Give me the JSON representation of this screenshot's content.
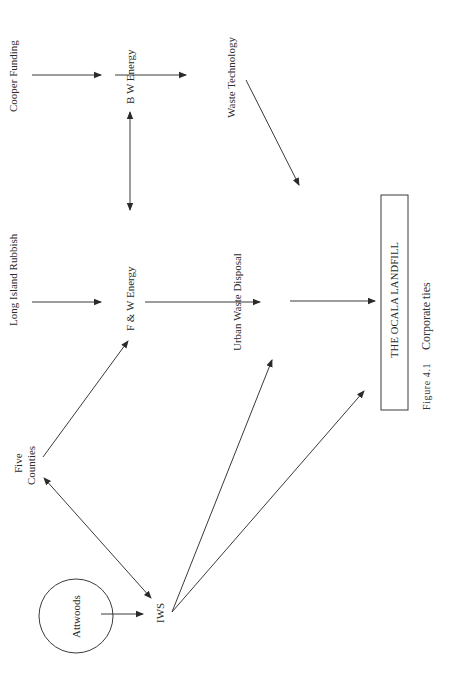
{
  "page": {
    "header_fragment": "...y... g... ...",
    "orientation": "rotated-90-clockwise"
  },
  "diagram": {
    "nodes": {
      "cooper_funding": "Cooper Funding",
      "bw_energy": "B W Energy",
      "waste_technology": "Waste Technology",
      "long_island_rubbish": "Long Island Rubbish",
      "fw_energy": "F & W Energy",
      "urban_waste_disposal": "Urban Waste Disposal",
      "five_counties_line1": "Five",
      "five_counties_line2": "Counties",
      "attwoods": "Attwoods",
      "iws": "IWS",
      "ocala_landfill": "THE OCALA LANDFILL"
    },
    "edges": [
      {
        "from": "Cooper Funding",
        "to": "B W Energy",
        "type": "directed"
      },
      {
        "from": "B W Energy",
        "to": "Waste Technology",
        "type": "directed"
      },
      {
        "from": "Waste Technology",
        "to": "THE OCALA LANDFILL",
        "type": "directed"
      },
      {
        "from": "B W Energy",
        "to": "F & W Energy",
        "type": "bidirectional"
      },
      {
        "from": "Long Island Rubbish",
        "to": "F & W Energy",
        "type": "directed"
      },
      {
        "from": "F & W Energy",
        "to": "Urban Waste Disposal",
        "type": "directed"
      },
      {
        "from": "Urban Waste Disposal",
        "to": "THE OCALA LANDFILL",
        "type": "directed"
      },
      {
        "from": "Five Counties",
        "to": "F & W Energy",
        "type": "directed"
      },
      {
        "from": "Five Counties",
        "to": "IWS",
        "type": "bidirectional"
      },
      {
        "from": "Attwoods",
        "to": "IWS",
        "type": "directed"
      },
      {
        "from": "IWS",
        "to": "Urban Waste Disposal",
        "type": "directed"
      },
      {
        "from": "IWS",
        "to": "THE OCALA LANDFILL",
        "type": "directed"
      }
    ]
  },
  "caption": {
    "figure_label": "Figure 4.1",
    "title": "Corporate ties"
  }
}
